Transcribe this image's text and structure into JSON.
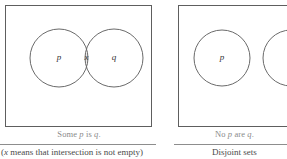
{
  "figure": {
    "panels": [
      {
        "id": "some-p-is-q",
        "caption_primary_pre": "Some ",
        "caption_primary_var1": "p",
        "caption_primary_mid": " is ",
        "caption_primary_var2": "q",
        "caption_primary_post": ".",
        "caption_secondary_pre": "(",
        "caption_secondary_var": "x",
        "caption_secondary_post": " means that intersection is not empty)",
        "circles": [
          {
            "label": "p",
            "cx": 59,
            "cy": 58,
            "r": 29
          },
          {
            "label": "q",
            "cx": 114,
            "cy": 58,
            "r": 29
          }
        ],
        "intersection_label": "x",
        "intersection_shaded": true
      },
      {
        "id": "no-p-are-q",
        "caption_primary_pre": "No ",
        "caption_primary_var1": "p",
        "caption_primary_mid": " are ",
        "caption_primary_var2": "q",
        "caption_primary_post": ".",
        "caption_secondary_pre": "",
        "caption_secondary_var": "",
        "caption_secondary_post": "Disjoint sets",
        "circles": [
          {
            "label": "p",
            "cx": 50,
            "cy": 58,
            "r": 28
          },
          {
            "label": "q",
            "cx": 119,
            "cy": 58,
            "r": 28
          }
        ],
        "intersection_label": "",
        "intersection_shaded": false
      }
    ],
    "colors": {
      "box_border": "#5e5e5e",
      "circle_stroke": "#6a6a6a",
      "lens_fill": "#eceaea",
      "caption_primary": "#8a8a8a",
      "caption_secondary": "#4a4a4a",
      "background": "#ffffff"
    }
  }
}
